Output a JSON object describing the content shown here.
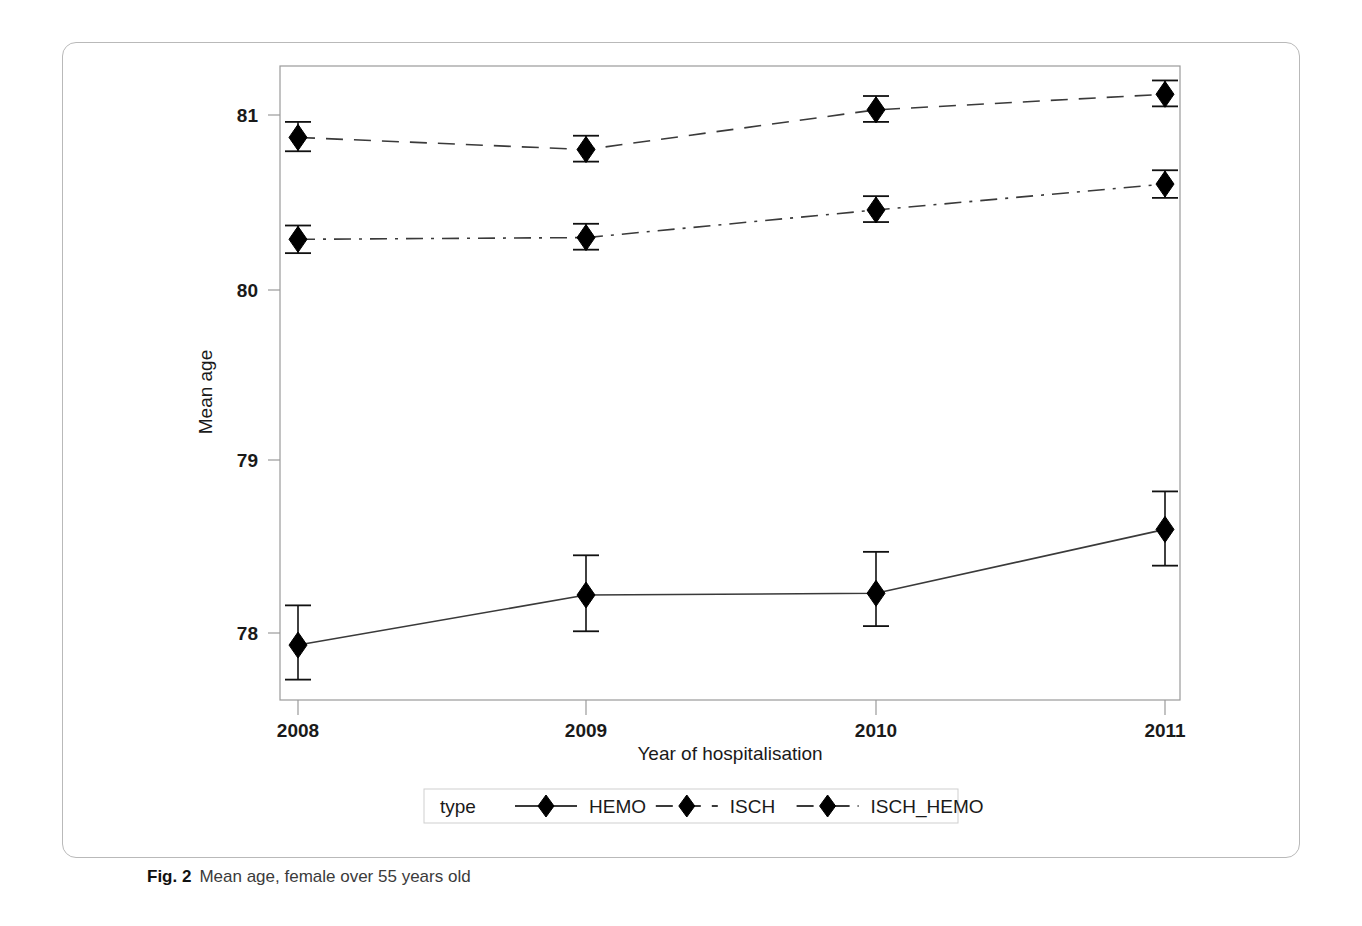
{
  "figure": {
    "caption_label": "Fig. 2",
    "caption_text": "Mean age, female over 55 years old"
  },
  "legend": {
    "title": "type",
    "entries": [
      {
        "label": "HEMO",
        "style": "solid"
      },
      {
        "label": "ISCH",
        "style": "dashed"
      },
      {
        "label": "ISCH_HEMO",
        "style": "dash-dot"
      }
    ]
  },
  "axes": {
    "x_title": "Year of hospitalisation",
    "y_title": "Mean age",
    "x_ticks": [
      "2008",
      "2009",
      "2010",
      "2011"
    ],
    "y_ticks": [
      "78",
      "79",
      "80",
      "81"
    ]
  },
  "chart_data": {
    "type": "line",
    "title": "Mean age, female over 55 years old",
    "xlabel": "Year of hospitalisation",
    "ylabel": "Mean age",
    "x": [
      2008,
      2009,
      2010,
      2011
    ],
    "categories": [
      "2008",
      "2009",
      "2010",
      "2011"
    ],
    "ylim": [
      77.6,
      81.4
    ],
    "grid": false,
    "legend_position": "bottom",
    "error_bars": true,
    "marker": "diamond",
    "series": [
      {
        "name": "HEMO",
        "style": "solid",
        "values": [
          77.93,
          78.22,
          78.23,
          78.6
        ],
        "error_low": [
          77.73,
          78.01,
          78.04,
          78.39
        ],
        "error_high": [
          78.16,
          78.45,
          78.47,
          78.82
        ]
      },
      {
        "name": "ISCH",
        "style": "dashed",
        "values": [
          80.87,
          80.8,
          81.03,
          81.12
        ],
        "error_low": [
          80.79,
          80.73,
          80.96,
          81.05
        ],
        "error_high": [
          80.96,
          80.88,
          81.11,
          81.2
        ]
      },
      {
        "name": "ISCH_HEMO",
        "style": "dash-dot",
        "values": [
          80.28,
          80.29,
          80.45,
          80.6
        ],
        "error_low": [
          80.2,
          80.22,
          80.38,
          80.52
        ],
        "error_high": [
          80.36,
          80.37,
          80.53,
          80.68
        ]
      }
    ]
  },
  "colors": {
    "line": "#3a3a3a",
    "marker": "#000000",
    "frame": "#9a9a9a",
    "card_border": "#b9b9b9"
  }
}
